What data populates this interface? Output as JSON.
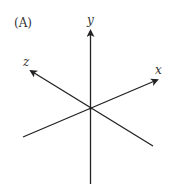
{
  "panel": {
    "label": "(A)"
  },
  "axes": {
    "x": {
      "label": "x"
    },
    "y": {
      "label": "y"
    },
    "z": {
      "label": "z"
    }
  },
  "colors": {
    "line": "#222222",
    "text": "#333333",
    "background": "#ffffff"
  }
}
